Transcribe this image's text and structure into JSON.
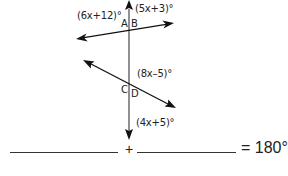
{
  "diagram": {
    "angle_labels": {
      "top_left": "(6x+12)°",
      "top_right": "(5x+3)°",
      "middle_right": "(8x–5)°",
      "bottom_right": "(4x+5)°"
    },
    "points": {
      "A": "A",
      "B": "B",
      "C": "C",
      "D": "D"
    },
    "lines": {
      "transversal": {
        "from": [
          129,
          0
        ],
        "to": [
          129,
          139
        ],
        "color": "#555555"
      },
      "line_1": {
        "from": [
          76,
          39
        ],
        "to": [
          174,
          23
        ],
        "color": "#111111"
      },
      "line_2": {
        "from": [
          83,
          60
        ],
        "to": [
          176,
          108
        ],
        "color": "#111111"
      }
    }
  },
  "equation": {
    "blank_1": "",
    "operator": "+",
    "blank_2": "",
    "result": "= 180°"
  }
}
